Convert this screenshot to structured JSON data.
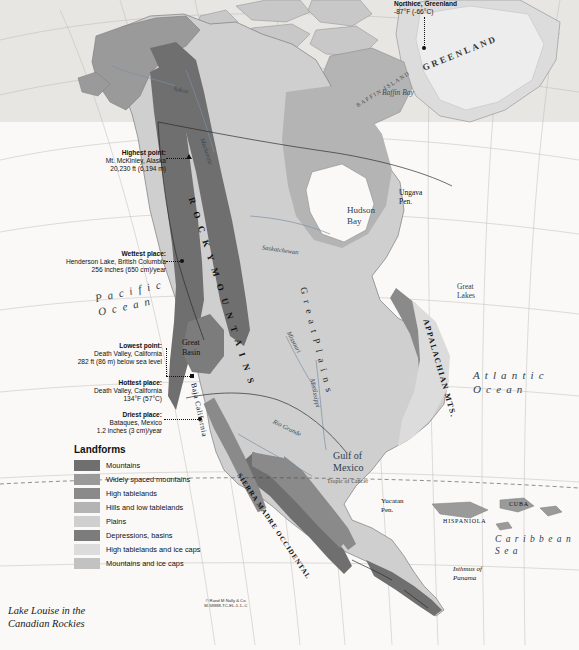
{
  "page": {
    "headline": "have volcanoes along the Pacific Coast.",
    "caption": "Lake Louise in the\nCanadian Rockies",
    "credit": "© Rand M·Nally & Co.\nM-58888-TC-EL-1-1--C"
  },
  "legend": {
    "title": "Landforms",
    "items": [
      {
        "label": "Mountains",
        "color": "#6f6f6f"
      },
      {
        "label": "Widely spaced mountains",
        "color": "#9a9a9a"
      },
      {
        "label": "High tablelands",
        "color": "#8a8a8a"
      },
      {
        "label": "Hills and low tablelands",
        "color": "#b4b4b4"
      },
      {
        "label": "Plains",
        "color": "#cfcfcf"
      },
      {
        "label": "Depressions, basins",
        "color": "#7c7c7c"
      },
      {
        "label": "High tablelands and ice caps",
        "color": "#dcdcdc"
      },
      {
        "label": "Mountains and ice caps",
        "color": "#c2c2c2"
      }
    ]
  },
  "callouts": [
    {
      "name": "northice-greenland",
      "lines": [
        "Northice, Greenland",
        "-87°F (-66°C)"
      ],
      "bold_first": true
    },
    {
      "name": "highest-point",
      "lines": [
        "Highest point:",
        "Mt. McKinley, Alaska",
        "20,230 ft (6,194 m)"
      ],
      "bold_first": true
    },
    {
      "name": "wettest-place",
      "lines": [
        "Wettest place:",
        "Henderson Lake, British Columbia",
        "256 inches (650 cm)/year"
      ],
      "bold_first": true
    },
    {
      "name": "lowest-point",
      "lines": [
        "Lowest point:",
        "Death Valley, California",
        "282 ft (86 m) below sea level"
      ],
      "bold_first": true
    },
    {
      "name": "hottest-place",
      "lines": [
        "Hottest place:",
        "Death Valley, California",
        "134°F (57°C)"
      ],
      "bold_first": true
    },
    {
      "name": "driest-place",
      "lines": [
        "Driest place:",
        "Bataques, Mexico",
        "1.2 inches (3 cm)/year"
      ],
      "bold_first": true
    }
  ],
  "map_labels": {
    "regions": [
      {
        "name": "greenland",
        "text": "GREENLAND"
      },
      {
        "name": "baffin-island",
        "text": "BAFFIN ISLAND"
      },
      {
        "name": "rocky-mountains",
        "text": "R O C K Y   M O U N T A I N S"
      },
      {
        "name": "appalachian-mts",
        "text": "APPALACHIAN MTS."
      },
      {
        "name": "great-plains",
        "text": "G r e a t   P l a i n s"
      },
      {
        "name": "sierra-madre-occidental",
        "text": "SIERRA MADRE OCCIDENTAL"
      },
      {
        "name": "baja-california",
        "text": "Baja California"
      },
      {
        "name": "great-basin",
        "text": "Great\nBasin"
      },
      {
        "name": "great-lakes",
        "text": "Great\nLakes"
      },
      {
        "name": "yucatan-peninsula",
        "text": "Yucatan\nPen."
      },
      {
        "name": "ungava-peninsula",
        "text": "Ungava\nPen."
      },
      {
        "name": "isthmus-of-panama",
        "text": "Isthmus of\nPanama"
      },
      {
        "name": "hispaniola",
        "text": "HISPANIOLA"
      },
      {
        "name": "cuba",
        "text": "CUBA"
      }
    ],
    "waters": [
      {
        "name": "pacific-ocean",
        "text": "P a c i f i c\nO c e a n"
      },
      {
        "name": "atlantic-ocean",
        "text": "A t l a n t i c\nO c e a n"
      },
      {
        "name": "caribbean-sea",
        "text": "C a r i b b e a n\nS e a"
      },
      {
        "name": "gulf-of-mexico",
        "text": "Gulf of\nMexico"
      },
      {
        "name": "hudson-bay",
        "text": "Hudson\nBay"
      },
      {
        "name": "baffin-bay",
        "text": "Baffin Bay"
      }
    ],
    "rivers": [
      {
        "name": "yukon-river",
        "text": "Yukon"
      },
      {
        "name": "mackenzie-river",
        "text": "Mackenzie"
      },
      {
        "name": "saskatchewan-river",
        "text": "Saskatchewan"
      },
      {
        "name": "missouri-river",
        "text": "Missouri"
      },
      {
        "name": "mississippi-river",
        "text": "Mississippi"
      },
      {
        "name": "rio-grande",
        "text": "Rio Grande"
      }
    ],
    "reference_lines": [
      {
        "name": "tropic-of-cancer",
        "text": "Tropic of Cancer"
      }
    ],
    "grid_numbers": [
      "160",
      "140",
      "120",
      "100",
      "80",
      "60",
      "40",
      "20",
      "70",
      "60",
      "50",
      "40",
      "30",
      "20"
    ]
  }
}
